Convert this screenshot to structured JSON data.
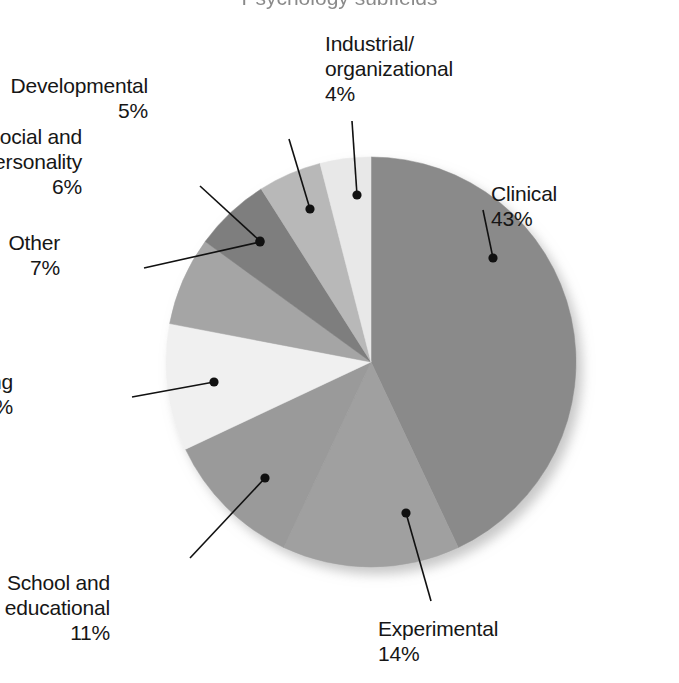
{
  "title": {
    "text": "Psychology subfields",
    "visible_fragment": true
  },
  "chart_data": {
    "type": "pie",
    "title": "Psychology subfields",
    "categories": [
      "Clinical",
      "Experimental",
      "School and educational",
      "Counseling",
      "Other",
      "Social and personality",
      "Developmental",
      "Industrial/organizational"
    ],
    "values": [
      43,
      14,
      11,
      10,
      7,
      6,
      5,
      4
    ],
    "unit": "%",
    "total": 100,
    "start_angle_deg": 0,
    "direction": "clockwise",
    "legend": "none",
    "labels_position": "outside-with-leader-lines",
    "colors": [
      "#8a8a8a",
      "#a0a0a0",
      "#9a9a9a",
      "#f0f0f0",
      "#a5a5a5",
      "#7e7e7e",
      "#b8b8b8",
      "#e8e8e8"
    ],
    "slices": [
      {
        "name": "Clinical",
        "value": 43,
        "value_label": "43%",
        "color": "#8a8a8a",
        "label_lines": [
          "Clinical",
          "43%"
        ],
        "label_x": 491,
        "label_y": 181,
        "label_align": "left",
        "dot_x": 493,
        "dot_y": 258,
        "elbow_x": 483,
        "elbow_y": 210
      },
      {
        "name": "Experimental",
        "value": 14,
        "value_label": "14%",
        "color": "#a0a0a0",
        "label_lines": [
          "Experimental",
          "14%"
        ],
        "label_x": 378,
        "label_y": 616,
        "label_align": "left",
        "dot_x": 406,
        "dot_y": 513,
        "elbow_x": 431,
        "elbow_y": 601
      },
      {
        "name": "School and educational",
        "value": 11,
        "value_label": "11%",
        "color": "#9a9a9a",
        "label_lines": [
          "School and",
          "educational",
          "11%"
        ],
        "label_x": 110,
        "label_y": 570,
        "label_align": "right",
        "dot_x": 265,
        "dot_y": 478,
        "elbow_x": 190,
        "elbow_y": 558
      },
      {
        "name": "Counseling",
        "value": 10,
        "value_label": "10%",
        "color": "#f0f0f0",
        "label_lines": [
          "Counseling",
          "10%"
        ],
        "label_x": 13,
        "label_y": 369,
        "label_align": "right",
        "dot_x": 214,
        "dot_y": 382,
        "elbow_x": 132,
        "elbow_y": 397
      },
      {
        "name": "Other",
        "value": 7,
        "value_label": "7%",
        "color": "#a5a5a5",
        "label_lines": [
          "Other",
          "7%"
        ],
        "label_x": 60,
        "label_y": 230,
        "label_align": "right",
        "dot_x": 260,
        "dot_y": 242,
        "elbow_x": 144,
        "elbow_y": 268
      },
      {
        "name": "Social and personality",
        "value": 6,
        "value_label": "6%",
        "color": "#7e7e7e",
        "label_lines": [
          "Social and",
          "personality",
          "6%"
        ],
        "label_x": 82,
        "label_y": 124,
        "label_align": "right",
        "dot_x": 260,
        "dot_y": 241,
        "elbow_x": 200,
        "elbow_y": 186
      },
      {
        "name": "Developmental",
        "value": 5,
        "value_label": "5%",
        "color": "#b8b8b8",
        "label_lines": [
          "Developmental",
          "5%"
        ],
        "label_x": 148,
        "label_y": 73,
        "label_align": "right",
        "dot_x": 310,
        "dot_y": 209,
        "elbow_x": 289,
        "elbow_y": 139
      },
      {
        "name": "Industrial/organizational",
        "value": 4,
        "value_label": "4%",
        "color": "#e8e8e8",
        "label_lines": [
          "Industrial/",
          "organizational",
          "4%"
        ],
        "label_x": 325,
        "label_y": 31,
        "label_align": "left",
        "dot_x": 357,
        "dot_y": 195,
        "elbow_x": 352,
        "elbow_y": 121
      }
    ],
    "geometry": {
      "center_x": 371,
      "center_y": 362,
      "radius": 205
    }
  }
}
